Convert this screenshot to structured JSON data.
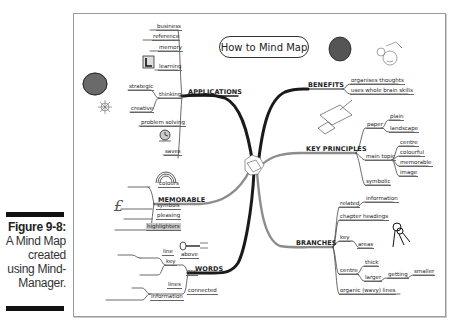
{
  "caption": {
    "title": "Figure 9-8:",
    "lines": [
      "A Mind Map",
      "created",
      "using Mind-",
      "Manager."
    ]
  },
  "mindmap": {
    "title": "How to Mind Map",
    "branches": {
      "applications": {
        "label": "APPLICATIONS",
        "children": {
          "business": "business",
          "reference": "reference",
          "memory": "memory",
          "learning": "learning",
          "thinking": "thinking",
          "strategic": "strategic",
          "creative": "creative",
          "problem_solving": "problem solving",
          "saves": "saves"
        }
      },
      "memorable": {
        "label": "MEMORABLE",
        "children": {
          "colours": "colours",
          "symbols": "symbols",
          "pleasing": "pleasing",
          "highlighters": "highlighters"
        }
      },
      "words": {
        "label": "WORDS",
        "children": {
          "key": "key",
          "above": "above",
          "line": "line",
          "one": "one",
          "connected": "connected",
          "lines": "lines",
          "information": "information"
        }
      },
      "benefits": {
        "label": "BENEFITS",
        "children": {
          "organises": "organises thoughts",
          "whole_brain": "uses whole brain skills"
        }
      },
      "key_principles": {
        "label": "KEY PRINCIPLES",
        "children": {
          "paper": "paper",
          "plain": "plain",
          "landscape": "landscape",
          "main_topic": "main topic",
          "centre": "centre",
          "colourful": "colourful",
          "memorable": "memorable",
          "image": "image",
          "symbolic": "symbolic"
        }
      },
      "branches": {
        "label": "BRANCHES",
        "children": {
          "related": "related",
          "information": "information",
          "chapter_headings": "chapter headings",
          "key": "key",
          "areas": "areas",
          "centre": "centre",
          "thick": "thick",
          "larger": "larger",
          "getting": "getting",
          "smaller": "smaller",
          "organic": "organic (wavy) lines"
        }
      }
    },
    "colors": {
      "main_branch_dark": "#1a1a1a",
      "main_branch_gray": "#8c8c8c",
      "frame_border": "#9a9a9a",
      "highlight": "#c8c8c8"
    }
  }
}
